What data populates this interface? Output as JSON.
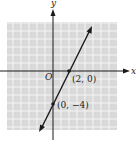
{
  "diagram": {
    "type": "coordinate-graph",
    "axes": {
      "x_label": "x",
      "y_label": "y",
      "origin_label": "O"
    },
    "line": {
      "slope": 2,
      "y_intercept": -4,
      "through": [
        [
          2,
          0
        ],
        [
          0,
          -4
        ]
      ]
    },
    "points": [
      {
        "label": "(2, 0)",
        "x": 2,
        "y": 0
      },
      {
        "label": "(0, −4)",
        "x": 0,
        "y": -4
      }
    ],
    "colors": {
      "grid_bg": "#d9d9d9",
      "grid_line": "#f4f4f4",
      "ink": "#1a1a1a"
    }
  }
}
